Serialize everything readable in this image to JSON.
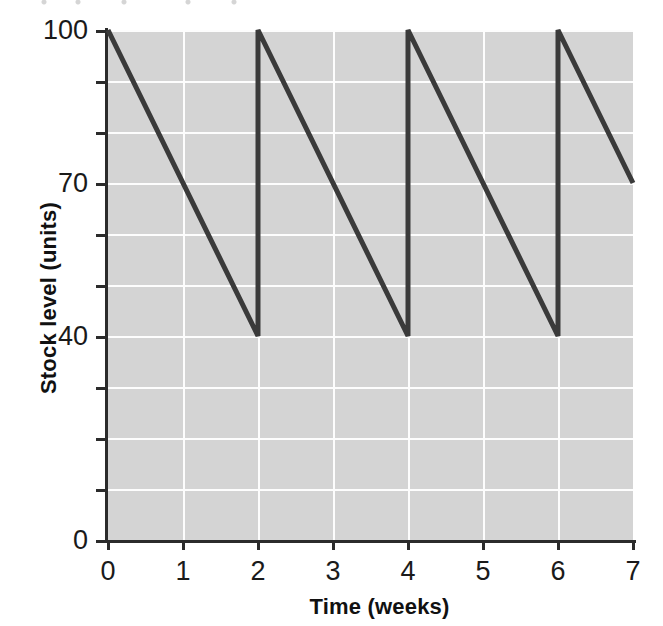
{
  "figure": {
    "background_color": "#ffffff",
    "plot_background_color": "#d4d4d4",
    "gridline_color": "#fdfdfd",
    "axis_color": "#2b2b2b",
    "series_color": "#3a3a3a"
  },
  "chart_data": {
    "type": "line",
    "title": "",
    "xlabel": "Time (weeks)",
    "ylabel": "Stock level (units)",
    "xlim": [
      0,
      7
    ],
    "ylim": [
      0,
      100
    ],
    "grid": true,
    "legend": null,
    "x_ticks": [
      0,
      1,
      2,
      3,
      4,
      5,
      6,
      7
    ],
    "x_tick_labels": [
      "0",
      "1",
      "2",
      "3",
      "4",
      "5",
      "6",
      "7"
    ],
    "y_ticks": [
      0,
      10,
      20,
      30,
      40,
      50,
      60,
      70,
      80,
      90,
      100
    ],
    "y_tick_labels": [
      "0",
      "",
      "",
      "",
      "40",
      "",
      "",
      "70",
      "",
      "",
      "100"
    ],
    "y_labeled_ticks": [
      {
        "value": 100,
        "label": "100"
      },
      {
        "value": 70,
        "label": "70"
      },
      {
        "value": 40,
        "label": "40"
      },
      {
        "value": 0,
        "label": "0"
      }
    ],
    "series": [
      {
        "name": "Stock level",
        "color": "#3a3a3a",
        "line_width": 5,
        "description": "Sawtooth inventory profile: stock falls linearly from 100 to 40 over 2 weeks, then is instantly replenished to 100.",
        "points": [
          {
            "x": 0,
            "y": 100
          },
          {
            "x": 2,
            "y": 40
          },
          {
            "x": 2,
            "y": 100
          },
          {
            "x": 4,
            "y": 40
          },
          {
            "x": 4,
            "y": 100
          },
          {
            "x": 6,
            "y": 40
          },
          {
            "x": 6,
            "y": 100
          },
          {
            "x": 7,
            "y": 70
          }
        ]
      }
    ],
    "annotations": [],
    "derived": {
      "maximum_stock_level": 100,
      "reorder_level": 40,
      "order_quantity": 60,
      "cycle_length_weeks": 2,
      "usage_rate_units_per_week": 30
    }
  }
}
